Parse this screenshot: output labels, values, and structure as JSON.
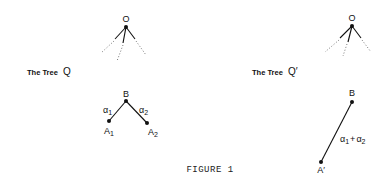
{
  "figure": {
    "caption": "FIGURE 1",
    "left_tree": {
      "title": "The Tree",
      "name": "Q",
      "root_label": "O",
      "subtree": {
        "parent_label": "B",
        "children": [
          {
            "label": "A",
            "subscript": "1",
            "edge_label": "α",
            "edge_subscript": "1"
          },
          {
            "label": "A",
            "subscript": "2",
            "edge_label": "α",
            "edge_subscript": "2"
          }
        ]
      }
    },
    "right_tree": {
      "title": "The Tree",
      "name": "Q′",
      "root_label": "O",
      "subtree": {
        "parent_label": "B",
        "child": {
          "label": "A′"
        },
        "edge_label": {
          "a": "α",
          "a_sub": "1",
          "plus": "+",
          "b": "α",
          "b_sub": "2"
        }
      }
    }
  }
}
